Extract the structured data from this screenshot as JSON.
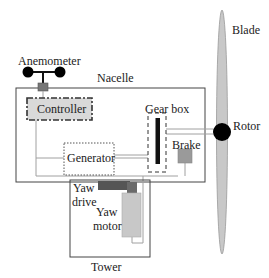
{
  "diagram": {
    "type": "wind-turbine-schematic",
    "labels": {
      "anemometer": "Anemometer",
      "nacelle": "Nacelle",
      "controller": "Controller",
      "gear_box": "Gear box",
      "rotor": "Rotor",
      "blade": "Blade",
      "generator": "Generator",
      "brake": "Brake",
      "yaw_drive_line1": "Yaw",
      "yaw_drive_line2": "drive",
      "yaw_motor_line1": "Yaw",
      "yaw_motor_line2": "motor",
      "tower": "Tower"
    },
    "colors": {
      "outline": "#333333",
      "component_fill": "#d9d9d9",
      "brake_fill": "#9a9a9a",
      "yaw_drive_fill": "#555555",
      "yaw_motor_fill": "#c8c8c8",
      "rotor_fill": "#000000",
      "blade_fill": "#c8c8c8",
      "connector_line": "#a0a0a0"
    }
  }
}
